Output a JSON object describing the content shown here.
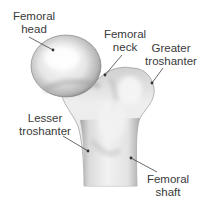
{
  "diagram": {
    "colors": {
      "background": "#ffffff",
      "bone_light": "#f2f2f2",
      "bone_shadow": "#8a8a8a",
      "text": "#3a3a3a",
      "leader": "#444444"
    },
    "labels": [
      {
        "id": "femoral-head",
        "line1": "Femoral",
        "line2": "head"
      },
      {
        "id": "femoral-neck",
        "line1": "Femoral",
        "line2": "neck"
      },
      {
        "id": "greater-troshanter",
        "line1": "Greater",
        "line2": "troshanter"
      },
      {
        "id": "lesser-troshanter",
        "line1": "Lesser",
        "line2": "troshanter"
      },
      {
        "id": "femoral-shaft",
        "line1": "Femoral",
        "line2": "shaft"
      }
    ]
  }
}
